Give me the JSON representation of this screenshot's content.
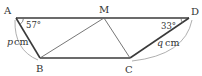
{
  "diagram": {
    "type": "trapezoid-geometry",
    "colors": {
      "stroke": "#3a3a3a",
      "thin_stroke": "#666666",
      "arc": "#9a9a9a",
      "text": "#333333",
      "background": "#ffffff"
    },
    "points": {
      "A": {
        "label": "A",
        "x": 16,
        "y": 18
      },
      "M": {
        "label": "M",
        "x": 104,
        "y": 18
      },
      "D": {
        "label": "D",
        "x": 189,
        "y": 18
      },
      "B": {
        "label": "B",
        "x": 40,
        "y": 58
      },
      "C": {
        "label": "C",
        "x": 130,
        "y": 58
      }
    },
    "angles": {
      "A": "57°",
      "D": "33°"
    },
    "lengths": {
      "AB_var": "p",
      "AB_unit": "cm",
      "CD_var": "q",
      "CD_unit": "cm"
    }
  }
}
